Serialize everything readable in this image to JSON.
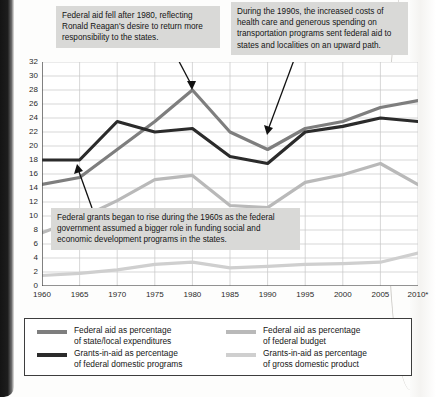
{
  "chart_data": {
    "type": "line",
    "title": "",
    "xlabel": "",
    "ylabel": "PERCENTAGE",
    "x": [
      "1960",
      "1965",
      "1970",
      "1975",
      "1980",
      "1985",
      "1990",
      "1995",
      "2000",
      "2005",
      "2010*"
    ],
    "xlim": [
      1960,
      2010
    ],
    "ylim": [
      0,
      32
    ],
    "ytick_step": 2,
    "yticks": [
      "0",
      "2",
      "4",
      "6",
      "8",
      "10",
      "12",
      "14",
      "16",
      "18",
      "20",
      "22",
      "24",
      "26",
      "28",
      "30",
      "32"
    ],
    "grid": true,
    "legend_position": "bottom",
    "series": [
      {
        "name": "Federal aid as percentage of state/local expenditures",
        "color": "#7e7e7e",
        "values": [
          14.5,
          15.5,
          19.5,
          23.5,
          28.0,
          22.0,
          19.5,
          22.5,
          23.5,
          25.5,
          26.5
        ]
      },
      {
        "name": "Grants-in-aid as percentage of federal domestic programs",
        "color": "#2b2b2b",
        "values": [
          18.0,
          18.0,
          23.5,
          22.0,
          22.5,
          18.5,
          17.5,
          22.0,
          22.8,
          24.0,
          23.5
        ]
      },
      {
        "name": "Federal aid as percentage of federal budget",
        "color": "#b9b9b9",
        "values": [
          7.6,
          9.6,
          12.2,
          15.2,
          15.8,
          11.5,
          11.2,
          14.8,
          15.9,
          17.5,
          14.5
        ]
      },
      {
        "name": "Grants-in-aid as percentage of gross domestic product",
        "color": "#cfcfcf",
        "values": [
          1.5,
          1.8,
          2.3,
          3.1,
          3.4,
          2.6,
          2.8,
          3.1,
          3.2,
          3.4,
          4.7
        ]
      }
    ]
  },
  "axis": {
    "y_title": "PERCENTAGE"
  },
  "callouts": {
    "reagan": "Federal aid fell after 1980, reflecting Ronald Reagan's desire to return more responsibility to the states.",
    "nineties": "During the 1990s, the increased costs of health care and generous spending on transportation programs sent federal aid to states and localities on an upward path.",
    "grants": "Federal grants began to rise during the 1960s as the federal government assumed a bigger role in funding social and economic development programs in the states."
  },
  "legend": {
    "items": [
      {
        "label_line1": "Federal aid as percentage",
        "label_line2": "of state/local expenditures",
        "color": "#7e7e7e"
      },
      {
        "label_line1": "Federal aid as percentage",
        "label_line2": "of federal budget",
        "color": "#b9b9b9"
      },
      {
        "label_line1": "Grants-in-aid as percentage",
        "label_line2": "of federal domestic programs",
        "color": "#2b2b2b"
      },
      {
        "label_line1": "Grants-in-aid as percentage",
        "label_line2": "of gross domestic product",
        "color": "#cfcfcf"
      }
    ]
  }
}
